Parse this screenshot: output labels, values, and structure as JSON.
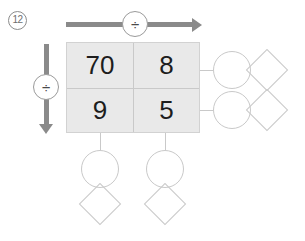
{
  "worksheet": {
    "problem_number": "12",
    "operators": {
      "top_label": "÷",
      "left_label": "÷"
    },
    "arrows": {
      "top_direction": "right",
      "left_direction": "down"
    },
    "grid": {
      "rows": [
        [
          "70",
          "8"
        ],
        [
          "9",
          "5"
        ]
      ]
    },
    "answers": {
      "right": [
        {
          "circle": "",
          "diamond": ""
        },
        {
          "circle": "",
          "diamond": ""
        }
      ],
      "bottom": [
        {
          "circle": "",
          "diamond": ""
        },
        {
          "circle": "",
          "diamond": ""
        }
      ]
    },
    "colors": {
      "arrow": "#8a8a8a",
      "grid_fill": "#e9e9e9",
      "grid_line": "#c9c9c9",
      "shape_outline": "#c9c9c9",
      "number_text": "#1d1d1d",
      "problem_number_text": "#6f6f6f"
    }
  }
}
